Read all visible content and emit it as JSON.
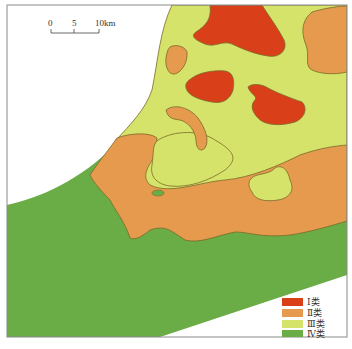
{
  "map": {
    "frame": {
      "x": 7,
      "y": 5,
      "width": 340,
      "height": 332,
      "stroke": "#8a8a8a"
    },
    "colors": {
      "class_I": "#d9401a",
      "class_II": "#e69a4e",
      "class_III": "#d6e36a",
      "class_IV": "#6aac45",
      "boundary": "#7a6a2a",
      "background": "#ffffff"
    }
  },
  "scale_bar": {
    "ticks": [
      "0",
      "5",
      "10km"
    ],
    "unit": "km"
  },
  "legend": {
    "items": [
      {
        "label": "Ⅰ类",
        "numeral": "Ⅰ",
        "suffix": "类",
        "color": "#d9401a"
      },
      {
        "label": "Ⅱ类",
        "numeral": "Ⅱ",
        "suffix": "类",
        "color": "#e69a4e"
      },
      {
        "label": "Ⅲ类",
        "numeral": "Ⅲ",
        "suffix": "类",
        "color": "#d6e36a"
      },
      {
        "label": "Ⅳ类",
        "numeral": "Ⅳ",
        "suffix": "类",
        "color": "#6aac45"
      }
    ]
  }
}
